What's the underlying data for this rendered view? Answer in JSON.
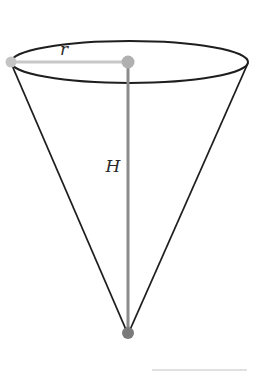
{
  "diagram": {
    "title": "",
    "shape": "inverted-cone",
    "labels": {
      "radius": "r",
      "height": "H"
    },
    "colors": {
      "outline": "#1e1e1e",
      "radius_line": "#c8c8c8",
      "height_line": "#8c8c8c",
      "points": "#9a9a9a",
      "apex_point": "#7a7a7a",
      "background": "#ffffff"
    }
  }
}
